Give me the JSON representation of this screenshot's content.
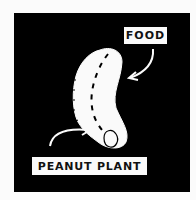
{
  "illustration": {
    "subject": "peanut seed diagram",
    "background_color": "#000000",
    "shape_color": "#fafafa",
    "labels": {
      "food": "FOOD",
      "peanut_plant": "PEANUT PLANT"
    }
  }
}
